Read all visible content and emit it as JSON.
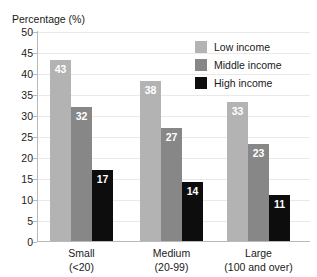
{
  "chart_data": {
    "type": "bar",
    "title": "",
    "xlabel": "",
    "ylabel": "Percentage (%)",
    "ylim": [
      0,
      50
    ],
    "yticks": [
      0,
      5,
      10,
      15,
      20,
      25,
      30,
      35,
      40,
      45,
      50
    ],
    "grid": true,
    "legend_position": "top-right",
    "categories": [
      "Small",
      "Medium",
      "Large"
    ],
    "category_sublabels": [
      "(<20)",
      "(20-99)",
      "(100 and over)"
    ],
    "series": [
      {
        "name": "Low income",
        "values": [
          43,
          38,
          33
        ],
        "color": "#b3b3b3"
      },
      {
        "name": "Middle income",
        "values": [
          32,
          27,
          23
        ],
        "color": "#878787"
      },
      {
        "name": "High income",
        "values": [
          17,
          14,
          11
        ],
        "color": "#0d0d0d"
      }
    ]
  },
  "axis": {
    "y_title": "Percentage (%)",
    "y_tick_labels": [
      "50",
      "45",
      "40",
      "35",
      "30",
      "25",
      "20",
      "15",
      "10",
      "5",
      "0"
    ],
    "x_tick_labels": [
      {
        "line1": "Small",
        "line2": "(<20)"
      },
      {
        "line1": "Medium",
        "line2": "(20-99)"
      },
      {
        "line1": "Large",
        "line2": "(100 and over)"
      }
    ]
  },
  "legend": {
    "items": [
      {
        "label": "Low income",
        "color": "#b3b3b3"
      },
      {
        "label": "Middle income",
        "color": "#878787"
      },
      {
        "label": "High income",
        "color": "#0d0d0d"
      }
    ]
  },
  "bar_labels": {
    "small": [
      "43",
      "32",
      "17"
    ],
    "medium": [
      "38",
      "27",
      "14"
    ],
    "large": [
      "33",
      "23",
      "11"
    ]
  },
  "cropped_title_fragment": ""
}
